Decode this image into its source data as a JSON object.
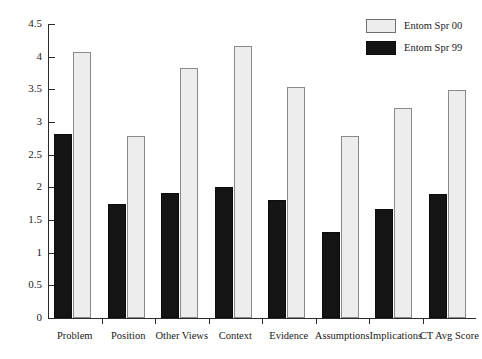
{
  "chart_data": {
    "type": "bar",
    "title": "",
    "subtitle": "",
    "xlabel": "",
    "ylabel": "",
    "ylim": [
      0,
      4.5
    ],
    "yticks": [
      "0",
      "0.5",
      "1",
      "1.5",
      "2",
      "2.5",
      "3",
      "3.5",
      "4",
      "4.5"
    ],
    "ytick_values": [
      0,
      0.5,
      1,
      1.5,
      2,
      2.5,
      3,
      3.5,
      4,
      4.5
    ],
    "grid": false,
    "legend_position": "top-right",
    "categories": [
      "Problem",
      "Position",
      "Other Views",
      "Context",
      "Evidence",
      "Assumptions",
      "Implications",
      "CT Avg Score"
    ],
    "series": [
      {
        "name": "Entom Spr 99",
        "color": "#141414",
        "values": [
          2.81,
          1.75,
          1.91,
          2.0,
          1.81,
          1.31,
          1.67,
          1.9
        ]
      },
      {
        "name": "Entom Spr 00",
        "color": "#ededed",
        "values": [
          4.07,
          2.78,
          3.82,
          4.17,
          3.53,
          2.78,
          3.21,
          3.49
        ]
      }
    ]
  },
  "legend": {
    "items": [
      {
        "label": "Entom Spr 00",
        "swatch": "light"
      },
      {
        "label": "Entom Spr 99",
        "swatch": "dark"
      }
    ]
  }
}
